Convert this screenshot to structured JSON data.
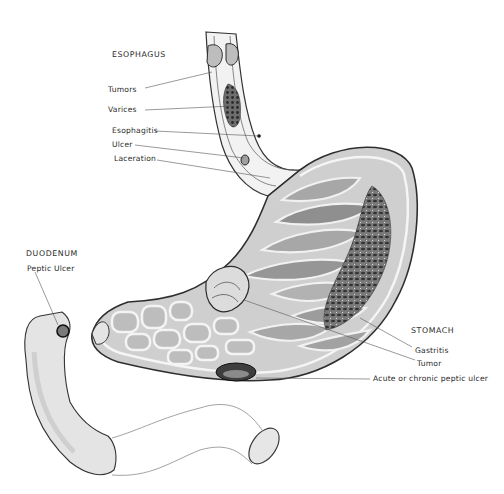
{
  "diagram": {
    "type": "anatomical-illustration",
    "regions": [
      {
        "id": "esophagus",
        "heading": "ESOPHAGUS",
        "labels": [
          "Tumors",
          "Varices",
          "Esophagitis",
          "Ulcer",
          "Laceration"
        ]
      },
      {
        "id": "duodenum",
        "heading": "DUODENUM",
        "labels": [
          "Peptic Ulcer"
        ]
      },
      {
        "id": "stomach",
        "heading": "STOMACH",
        "labels": [
          "Gastritis",
          "Tumor",
          "Acute or chronic peptic ulcer"
        ]
      }
    ]
  },
  "labels": {
    "esophagus": "ESOPHAGUS",
    "tumors": "Tumors",
    "varices": "Varices",
    "esophagitis": "Esophagitis",
    "ulcer": "Ulcer",
    "laceration": "Laceration",
    "duodenum": "DUODENUM",
    "peptic_ulcer": "Peptic Ulcer",
    "stomach": "STOMACH",
    "gastritis": "Gastritis",
    "tumor": "Tumor",
    "acute_ulcer": "Acute or chronic peptic ulcer"
  },
  "colors": {
    "ink": "#2b2b2b",
    "wall": "#3a3a3a",
    "mucosa_dark": "#8c8c8c",
    "mucosa_mid": "#b4b4b4",
    "mucosa_light": "#d8d8d8",
    "background": "#ffffff"
  }
}
